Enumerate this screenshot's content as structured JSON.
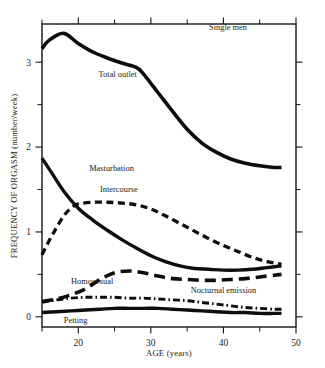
{
  "chart_data": {
    "type": "line",
    "title": "Single men",
    "xlabel": "AGE (years)",
    "ylabel": "FREQUENCY OF ORGASM (number/week)",
    "xlim": [
      15,
      50
    ],
    "ylim": [
      -0.12,
      3.45
    ],
    "grid": false,
    "legend_position": "inline-annotations",
    "xticks": [
      20,
      30,
      40,
      50
    ],
    "xticks_minor": [
      15,
      25,
      35,
      45
    ],
    "yticks": [
      0,
      1,
      2,
      3
    ],
    "yticks_minor": [
      0.5,
      1.5,
      2.5
    ],
    "series": [
      {
        "name": "Total outlet",
        "style": "solid",
        "label_x": 22.8,
        "label_y": 2.82,
        "x": [
          15,
          16,
          18,
          20,
          22,
          24,
          26,
          28,
          29,
          31,
          33,
          35,
          37,
          39,
          41,
          43,
          45,
          47,
          48
        ],
        "y": [
          3.16,
          3.26,
          3.34,
          3.22,
          3.12,
          3.05,
          2.99,
          2.94,
          2.86,
          2.64,
          2.42,
          2.21,
          2.05,
          1.94,
          1.86,
          1.81,
          1.78,
          1.76,
          1.76
        ]
      },
      {
        "name": "Masturbation",
        "style": "hatched",
        "label_x": 21.5,
        "label_y": 1.72,
        "x": [
          15,
          16,
          18,
          20,
          22,
          24,
          26,
          28,
          30,
          32,
          34,
          36,
          38,
          40,
          42,
          44,
          46,
          48
        ],
        "y": [
          1.87,
          1.74,
          1.48,
          1.28,
          1.14,
          1.02,
          0.91,
          0.81,
          0.72,
          0.65,
          0.6,
          0.57,
          0.56,
          0.55,
          0.55,
          0.56,
          0.58,
          0.6
        ]
      },
      {
        "name": "Intercourse",
        "style": "dashed",
        "label_x": 23.0,
        "label_y": 1.47,
        "x": [
          15,
          16,
          17,
          18,
          19,
          20,
          22,
          24,
          26,
          28,
          30,
          32,
          34,
          36,
          38,
          40,
          42,
          44,
          46,
          48
        ],
        "y": [
          0.73,
          0.9,
          1.05,
          1.19,
          1.28,
          1.33,
          1.35,
          1.35,
          1.34,
          1.32,
          1.27,
          1.19,
          1.1,
          1.01,
          0.92,
          0.84,
          0.77,
          0.7,
          0.65,
          0.62
        ]
      },
      {
        "name": "Homosexual",
        "style": "long-dashed",
        "label_x": 19.0,
        "label_y": 0.39,
        "x": [
          15,
          17,
          19,
          21,
          23,
          25,
          27,
          29,
          31,
          33,
          35,
          37,
          39,
          41,
          43,
          45,
          47,
          48
        ],
        "y": [
          0.18,
          0.21,
          0.26,
          0.33,
          0.44,
          0.52,
          0.54,
          0.52,
          0.48,
          0.45,
          0.44,
          0.43,
          0.43,
          0.44,
          0.45,
          0.47,
          0.49,
          0.5
        ]
      },
      {
        "name": "Nocturnal emission",
        "style": "dash-dot",
        "label_x": 35.5,
        "label_y": 0.28,
        "x": [
          15,
          17,
          19,
          21,
          23,
          25,
          27,
          29,
          31,
          33,
          35,
          37,
          39,
          41,
          43,
          45,
          47,
          48
        ],
        "y": [
          0.17,
          0.2,
          0.22,
          0.23,
          0.23,
          0.23,
          0.22,
          0.22,
          0.21,
          0.2,
          0.19,
          0.17,
          0.15,
          0.13,
          0.11,
          0.1,
          0.09,
          0.09
        ]
      },
      {
        "name": "Petting",
        "style": "hatched",
        "label_x": 18.0,
        "label_y": -0.07,
        "x": [
          15,
          17,
          19,
          21,
          23,
          25,
          27,
          29,
          31,
          33,
          35,
          37,
          39,
          41,
          43,
          45,
          47,
          48
        ],
        "y": [
          0.05,
          0.06,
          0.07,
          0.08,
          0.09,
          0.1,
          0.1,
          0.1,
          0.1,
          0.09,
          0.08,
          0.07,
          0.06,
          0.05,
          0.05,
          0.04,
          0.04,
          0.04
        ]
      }
    ]
  }
}
